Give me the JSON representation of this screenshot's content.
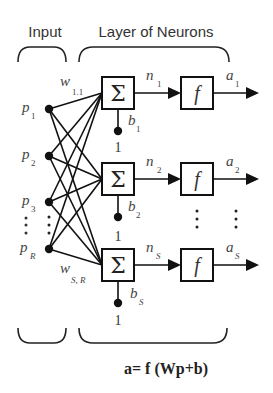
{
  "header": {
    "input_label": "Input",
    "layer_label": "Layer of Neurons"
  },
  "inputs": [
    {
      "label": "p",
      "sub": "1"
    },
    {
      "label": "p",
      "sub": "2"
    },
    {
      "label": "p",
      "sub": "3"
    },
    {
      "label": "p",
      "sub": "R"
    }
  ],
  "weights": {
    "first": {
      "label": "w",
      "sub": "1.1"
    },
    "last": {
      "label": "w",
      "sub": "S, R"
    }
  },
  "neurons": [
    {
      "sum_symbol": "Σ",
      "n": "n",
      "n_sub": "1",
      "f": "f",
      "a": "a",
      "a_sub": "1",
      "b": "b",
      "b_sub": "1",
      "bias_input": "1"
    },
    {
      "sum_symbol": "Σ",
      "n": "n",
      "n_sub": "2",
      "f": "f",
      "a": "a",
      "a_sub": "2",
      "b": "b",
      "b_sub": "2",
      "bias_input": "1"
    },
    {
      "sum_symbol": "Σ",
      "n": "n",
      "n_sub": "S",
      "f": "f",
      "a": "a",
      "a_sub": "S",
      "b": "b",
      "b_sub": "S",
      "bias_input": "1"
    }
  ],
  "formula": "a= f (Wp+b)",
  "colors": {
    "background": "#ffffff",
    "lines": "#111111",
    "text": "#333333"
  }
}
